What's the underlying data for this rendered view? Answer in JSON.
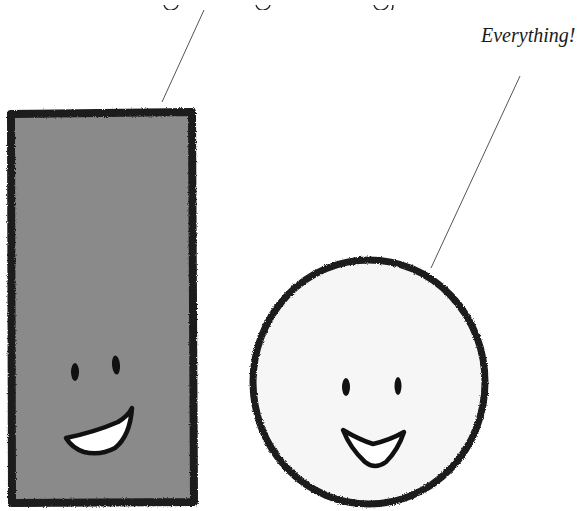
{
  "scene": {
    "background_color": "#ffffff",
    "top_caption": {
      "text": "",
      "note_visible": "clipped descenders only"
    },
    "right_caption": {
      "text": "Everything!"
    },
    "rectangle_character": {
      "fill_color": "#8a8a8a",
      "outline_color": "#1a1a1a",
      "expression": "smiling"
    },
    "circle_character": {
      "fill_color": "#f6f6f6",
      "outline_color": "#1a1a1a",
      "expression": "smiling"
    },
    "leader_line_color": "#555555"
  }
}
